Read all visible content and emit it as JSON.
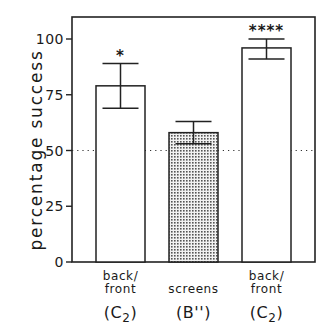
{
  "chart_data": {
    "type": "bar",
    "title": "",
    "xlabel": "",
    "ylabel": "percentage success",
    "ylim": [
      0,
      110
    ],
    "yticks": [
      0,
      25,
      50,
      75,
      100
    ],
    "grid": false,
    "reference_line": {
      "y": 50,
      "style": "dotted",
      "label": "chance"
    },
    "categories": [
      "back/front (C2)",
      "screens (B'')",
      "back/front (C2)"
    ],
    "category_labels": [
      {
        "line1": "back/",
        "line2": "front",
        "code_main": "(C",
        "code_sub": "2",
        "code_end": ")"
      },
      {
        "line1": "",
        "line2": "screens",
        "code_main": "(B'')",
        "code_sub": "",
        "code_end": ""
      },
      {
        "line1": "back/",
        "line2": "front",
        "code_main": "(C",
        "code_sub": "2",
        "code_end": ")"
      }
    ],
    "values": [
      79,
      58,
      96
    ],
    "error_upper": [
      89,
      63,
      100
    ],
    "error_lower": [
      69,
      53,
      91
    ],
    "fill": [
      "white",
      "stippled",
      "white"
    ],
    "significance": [
      "*",
      "",
      "****"
    ]
  },
  "axis": {
    "tick_labels": [
      "0",
      "25",
      "50",
      "75",
      "100"
    ],
    "ylabel": "percentage success"
  }
}
